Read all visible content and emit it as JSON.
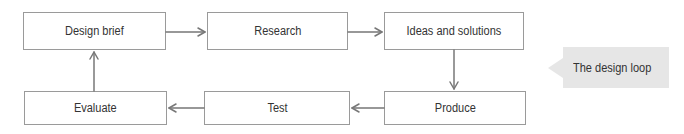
{
  "diagram": {
    "title": "The design loop",
    "nodes": [
      {
        "id": "brief",
        "label": "Design brief"
      },
      {
        "id": "research",
        "label": "Research"
      },
      {
        "id": "ideas",
        "label": "Ideas and solutions"
      },
      {
        "id": "produce",
        "label": "Produce"
      },
      {
        "id": "test",
        "label": "Test"
      },
      {
        "id": "evaluate",
        "label": "Evaluate"
      }
    ],
    "edges": [
      {
        "from": "brief",
        "to": "research"
      },
      {
        "from": "research",
        "to": "ideas"
      },
      {
        "from": "ideas",
        "to": "produce"
      },
      {
        "from": "produce",
        "to": "test"
      },
      {
        "from": "test",
        "to": "evaluate"
      },
      {
        "from": "evaluate",
        "to": "brief"
      }
    ],
    "callout": "The design loop"
  },
  "colors": {
    "border": "#9a9a9a",
    "arrow": "#777777",
    "callout_bg": "#e6e6e6",
    "text": "#333333"
  }
}
